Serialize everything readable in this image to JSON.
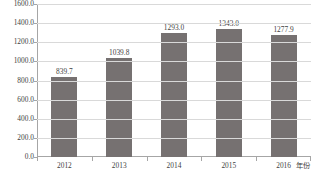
{
  "chart_data": {
    "type": "bar",
    "title": "",
    "xlabel": "年份",
    "ylabel": "",
    "categories": [
      "2012",
      "2013",
      "2014",
      "2015",
      "2016"
    ],
    "values": [
      839.7,
      1039.8,
      1293.0,
      1343.0,
      1277.9
    ],
    "data_labels": [
      "839.7",
      "1039.8",
      "1293.0",
      "1343.0",
      "1277.9"
    ],
    "ylim": [
      0,
      1600
    ],
    "ytick_step": 200,
    "yticks": [
      0,
      200,
      400,
      600,
      800,
      1000,
      1200,
      1400,
      1600
    ],
    "ytick_labels": [
      "0.0",
      "200.0",
      "400.0",
      "600.0",
      "800.0",
      "1000.0",
      "1200.0",
      "1400.0",
      "1600.0"
    ],
    "grid": true,
    "grid_axis": "y",
    "legend": false,
    "legend_position": "none",
    "series": [
      {
        "name": "",
        "values": [
          839.7,
          1039.8,
          1293.0,
          1343.0,
          1277.9
        ],
        "color": "#767171"
      }
    ],
    "colors": {
      "bar": "#767171",
      "grid": "#d9d9d9",
      "axis": "#a6a6a6",
      "text": "#3f3f3f",
      "background": "#ffffff"
    }
  }
}
